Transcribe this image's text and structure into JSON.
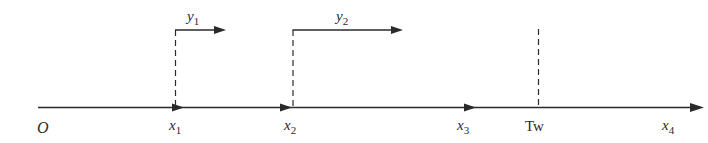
{
  "diagram": {
    "type": "timeline-axis",
    "colors": {
      "line": "#2a2a2a",
      "background": "#ffffff"
    },
    "axis": {
      "origin_label": "O",
      "end_label_base": "x",
      "end_label_sub": "4"
    },
    "points": [
      {
        "id": "x1",
        "base": "x",
        "sub": "1"
      },
      {
        "id": "x2",
        "base": "x",
        "sub": "2"
      },
      {
        "id": "x3",
        "base": "x",
        "sub": "3"
      },
      {
        "id": "tw",
        "label": "Tw"
      }
    ],
    "branches": [
      {
        "id": "y1",
        "base": "y",
        "sub": "1",
        "from": "x1"
      },
      {
        "id": "y2",
        "base": "y",
        "sub": "2",
        "from": "x2"
      }
    ]
  }
}
